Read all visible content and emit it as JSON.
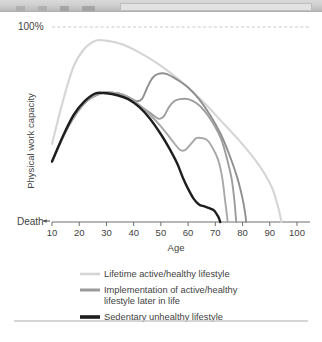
{
  "toolbar": {
    "icons": [
      "tool-icon-1",
      "tool-icon-2",
      "tool-icon-3",
      "tool-icon-4",
      "tool-icon-5"
    ],
    "field_placeholder": ""
  },
  "chart_data": {
    "type": "line",
    "title": "",
    "xlabel": "Age",
    "ylabel": "Physical work capacity",
    "xlim": [
      10,
      100
    ],
    "ylim": [
      0,
      100
    ],
    "xticks": [
      10,
      20,
      30,
      40,
      50,
      60,
      70,
      80,
      90,
      100
    ],
    "ytick_labels": [
      "100%",
      "Death"
    ],
    "grid": false,
    "reference_lines": [
      {
        "name": "hundred-percent",
        "y": 100,
        "label": "100%",
        "style": "dashed",
        "color": "#c9c9c9"
      }
    ],
    "annotations": [
      {
        "name": "death-arrow",
        "text": "Death",
        "at": [
          10,
          0
        ]
      }
    ],
    "legend_position": "below-axis",
    "series": [
      {
        "name": "Lifetime active/healthy lifestyle",
        "color": "#d5d5d5",
        "width": 2.1,
        "points": [
          [
            10,
            40
          ],
          [
            14,
            62
          ],
          [
            18,
            80
          ],
          [
            22,
            89
          ],
          [
            26,
            93
          ],
          [
            30,
            93
          ],
          [
            36,
            91
          ],
          [
            42,
            87
          ],
          [
            48,
            82
          ],
          [
            54,
            76
          ],
          [
            60,
            69
          ],
          [
            66,
            61
          ],
          [
            72,
            52
          ],
          [
            78,
            43
          ],
          [
            84,
            33
          ],
          [
            88,
            25
          ],
          [
            91,
            17
          ],
          [
            93,
            8
          ],
          [
            94,
            2
          ],
          [
            94.2,
            0
          ]
        ]
      },
      {
        "name": "Implementation of active/healthy lifestyle later in life",
        "color": "#8f8f8f",
        "width": 1.9,
        "points": [
          [
            10,
            31
          ],
          [
            16,
            49
          ],
          [
            22,
            61
          ],
          [
            28,
            66
          ],
          [
            34,
            66
          ],
          [
            38,
            64
          ],
          [
            41,
            62
          ],
          [
            43,
            63
          ],
          [
            45,
            69
          ],
          [
            47,
            74
          ],
          [
            49,
            76
          ],
          [
            52,
            76
          ],
          [
            56,
            73
          ],
          [
            60,
            69
          ],
          [
            64,
            63
          ],
          [
            68,
            55
          ],
          [
            72,
            45
          ],
          [
            75,
            35
          ],
          [
            78,
            23
          ],
          [
            80,
            12
          ],
          [
            81,
            4
          ],
          [
            81.3,
            0
          ]
        ]
      },
      {
        "name": "Implementation of active/healthy lifestyle later in life",
        "color": "#9d9d9d",
        "width": 1.9,
        "points": [
          [
            10,
            31
          ],
          [
            16,
            49
          ],
          [
            22,
            61
          ],
          [
            28,
            66
          ],
          [
            34,
            66
          ],
          [
            38,
            64
          ],
          [
            42,
            60
          ],
          [
            46,
            56
          ],
          [
            49,
            53
          ],
          [
            51,
            54
          ],
          [
            53,
            59
          ],
          [
            55,
            62
          ],
          [
            57,
            63
          ],
          [
            60,
            63
          ],
          [
            63,
            61
          ],
          [
            66,
            57
          ],
          [
            69,
            51
          ],
          [
            72,
            43
          ],
          [
            74,
            34
          ],
          [
            76,
            22
          ],
          [
            77,
            11
          ],
          [
            77.5,
            3
          ],
          [
            77.7,
            0
          ]
        ]
      },
      {
        "name": "Implementation of active/healthy lifestyle later in life",
        "color": "#a8a8a8",
        "width": 1.9,
        "points": [
          [
            10,
            31
          ],
          [
            16,
            49
          ],
          [
            22,
            61
          ],
          [
            28,
            66
          ],
          [
            34,
            66
          ],
          [
            38,
            64
          ],
          [
            42,
            60
          ],
          [
            46,
            55
          ],
          [
            50,
            49
          ],
          [
            54,
            42
          ],
          [
            57,
            37
          ],
          [
            59,
            37
          ],
          [
            61,
            40
          ],
          [
            63,
            43
          ],
          [
            65,
            43
          ],
          [
            67,
            42
          ],
          [
            69,
            38
          ],
          [
            71,
            32
          ],
          [
            72.5,
            23
          ],
          [
            73.5,
            12
          ],
          [
            74.3,
            3
          ],
          [
            74.5,
            0
          ]
        ]
      },
      {
        "name": "Sedentary unhealthy lifestyle",
        "color": "#1e1e1e",
        "width": 2.4,
        "points": [
          [
            10,
            31
          ],
          [
            14,
            44
          ],
          [
            18,
            55
          ],
          [
            22,
            62
          ],
          [
            26,
            66
          ],
          [
            30,
            66
          ],
          [
            34,
            65
          ],
          [
            38,
            63
          ],
          [
            42,
            59
          ],
          [
            46,
            53
          ],
          [
            50,
            45
          ],
          [
            53,
            38
          ],
          [
            56,
            30
          ],
          [
            58,
            23
          ],
          [
            60,
            17
          ],
          [
            62,
            12
          ],
          [
            64,
            9
          ],
          [
            66,
            8
          ],
          [
            68,
            7
          ],
          [
            69.5,
            6
          ],
          [
            70.5,
            4
          ],
          [
            71.3,
            2
          ],
          [
            71.8,
            0
          ]
        ]
      }
    ],
    "legend": [
      {
        "label": "Lifetime active/healthy lifestyle",
        "color": "#d5d5d5",
        "width": 2.6
      },
      {
        "label": "Implementation of active/healthy",
        "label2": "lifestyle later in life",
        "color": "#9a9a9a",
        "width": 3.0
      },
      {
        "label": "Sedentary unhealthy lifestyle",
        "color": "#1e1e1e",
        "width": 3.6
      }
    ]
  },
  "footer": {
    "divider": "horizontal-rule"
  }
}
